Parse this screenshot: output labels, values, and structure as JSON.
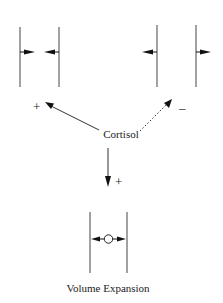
{
  "diagram": {
    "center_label": "Cortisol",
    "bottom_label": "Volume Expansion",
    "effects": [
      {
        "name": "left",
        "sign": "+",
        "style": "solid",
        "description": "inward arrows between two membranes"
      },
      {
        "name": "right",
        "sign": "-",
        "style": "dotted",
        "description": "outward arrows from two membranes"
      },
      {
        "name": "down",
        "sign": "+",
        "style": "solid",
        "description": "outward arrows from central circle"
      }
    ],
    "colors": {
      "line": "#333333",
      "arrow": "#111111",
      "background": "#ffffff"
    }
  }
}
